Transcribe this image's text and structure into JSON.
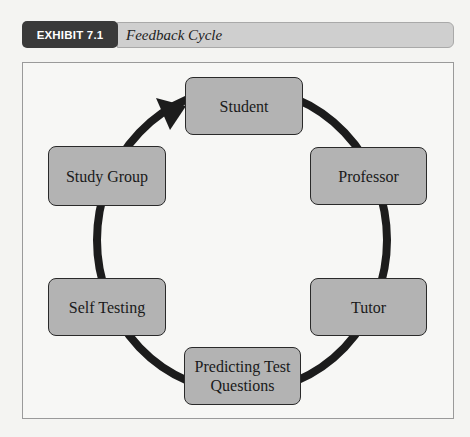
{
  "exhibit": {
    "label": "EXHIBIT 7.1",
    "title": "Feedback Cycle"
  },
  "diagram": {
    "type": "cycle",
    "colors": {
      "node_fill": "#b3b3b3",
      "node_border": "#2a2a2a",
      "ring": "#1c1c1c",
      "label_bg": "#3a3a3a",
      "title_bg": "#cfcfcf"
    },
    "nodes": [
      {
        "id": "student",
        "label": "Student"
      },
      {
        "id": "professor",
        "label": "Professor"
      },
      {
        "id": "tutor",
        "label": "Tutor"
      },
      {
        "id": "predicting",
        "label": "Predicting Test Questions"
      },
      {
        "id": "self-testing",
        "label": "Self Testing"
      },
      {
        "id": "study-group",
        "label": "Study Group"
      }
    ],
    "flow": "Study Group → Student (arrowhead); cycle connects Student, Professor, Tutor, Predicting Test Questions, Self Testing, Study Group"
  }
}
